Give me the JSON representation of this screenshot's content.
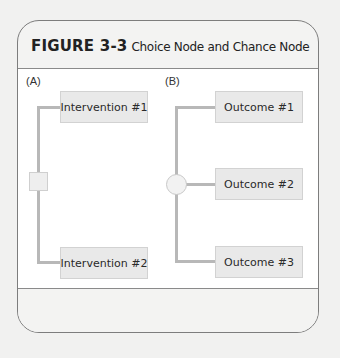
{
  "figure": {
    "label": "FIGURE 3-3",
    "caption": "Choice Node and Chance Node"
  },
  "panels": {
    "a": {
      "label": "(A)",
      "node_type": "choice-node-square",
      "branches": [
        "Intervention #1",
        "Intervention #2"
      ]
    },
    "b": {
      "label": "(B)",
      "node_type": "chance-node-circle",
      "branches": [
        "Outcome #1",
        "Outcome #2",
        "Outcome #3"
      ]
    }
  },
  "colors": {
    "box_fill": "#e9e9e9",
    "line": "#b8b8b8",
    "border": "#7d7d7d",
    "background": "#f1f1f0"
  }
}
